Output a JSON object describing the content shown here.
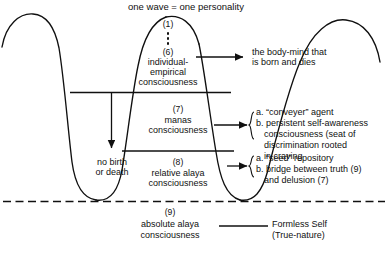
{
  "diagram": {
    "title": "one wave = one personality",
    "wave_label_top": "one wave = one personality",
    "levels": [
      {
        "number": "(1)",
        "number_bottom": "(6)",
        "label_line1": "individual-",
        "label_line2": "empirical",
        "label_line3": "consciousness",
        "callout": [
          "the body-mind that",
          "is born and dies"
        ]
      },
      {
        "number": "(7)",
        "label_line1": "manas",
        "label_line2": "consciousness",
        "callout": [
          "a. “conveyer” agent",
          "b. persistent self-awareness",
          "consciousness (seat of",
          "discrimination rooted",
          "in craving"
        ]
      },
      {
        "number": "(8)",
        "label_line1": "relative alaya",
        "label_line2": "consciousness",
        "callout": [
          "a. “seed” repository",
          "b. bridge between truth (9)",
          "and delusion (7)"
        ]
      },
      {
        "number": "(9)",
        "label_line1": "absolute alaya",
        "label_line2": "consciousness",
        "callout": [
          "Formless Self",
          "(True-nature)"
        ]
      }
    ],
    "trough_label": [
      "no birth",
      "or death"
    ],
    "colors": {
      "ink": "#101010",
      "background": "#ffffff"
    }
  }
}
